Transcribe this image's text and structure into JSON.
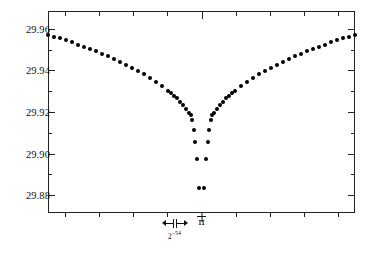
{
  "chart_data": {
    "type": "scatter",
    "title": "",
    "subtitle": "",
    "xlabel": "",
    "ylabel": "",
    "xlim": [
      -1.0,
      1.0
    ],
    "ylim": [
      29.8715,
      29.9685
    ],
    "grid": false,
    "legend": null,
    "y_ticks_major": [
      "29.96",
      "29.94",
      "29.92",
      "29.90",
      "29.88"
    ],
    "y_ticks_major_values": [
      29.96,
      29.94,
      29.92,
      29.9,
      29.88
    ],
    "y_minor_ticks_between": 1,
    "x_tick_count": 9,
    "x_center_annotation": "π",
    "x_span_annotation": "2",
    "x_span_exponent": "−54",
    "x_span_annotation_full": "2⁻⁵⁴",
    "series": [
      {
        "name": "computed value",
        "marker": "filled-circle",
        "color": "#000000",
        "points": [
          [
            -1.0,
            29.9571
          ],
          [
            -0.9608,
            29.9562
          ],
          [
            -0.9216,
            29.9553
          ],
          [
            -0.8824,
            29.9544
          ],
          [
            -0.8431,
            29.9534
          ],
          [
            -0.8039,
            29.9524
          ],
          [
            -0.7647,
            29.9514
          ],
          [
            -0.7255,
            29.9503
          ],
          [
            -0.6863,
            29.9492
          ],
          [
            -0.6471,
            29.948
          ],
          [
            -0.6078,
            29.9468
          ],
          [
            -0.5686,
            29.9455
          ],
          [
            -0.5294,
            29.9442
          ],
          [
            -0.4902,
            29.9428
          ],
          [
            -0.451,
            29.9413
          ],
          [
            -0.4118,
            29.9398
          ],
          [
            -0.3725,
            29.9381
          ],
          [
            -0.3333,
            29.9364
          ],
          [
            -0.2941,
            29.9345
          ],
          [
            -0.2549,
            29.9325
          ],
          [
            -0.2157,
            29.9303
          ],
          [
            -0.1961,
            29.9291
          ],
          [
            -0.1765,
            29.9279
          ],
          [
            -0.1569,
            29.9265
          ],
          [
            -0.1373,
            29.925
          ],
          [
            -0.1176,
            29.9234
          ],
          [
            -0.098,
            29.9216
          ],
          [
            -0.0784,
            29.9196
          ],
          [
            -0.0686,
            29.9184
          ],
          [
            -0.0588,
            29.916
          ],
          [
            -0.049,
            29.9114
          ],
          [
            -0.0392,
            29.9057
          ],
          [
            -0.0294,
            29.8975
          ],
          [
            -0.0147,
            29.8835
          ],
          [
            0.0147,
            29.8835
          ],
          [
            0.0294,
            29.8975
          ],
          [
            0.0392,
            29.9057
          ],
          [
            0.049,
            29.9114
          ],
          [
            0.0588,
            29.916
          ],
          [
            0.0686,
            29.9184
          ],
          [
            0.0784,
            29.9196
          ],
          [
            0.098,
            29.9216
          ],
          [
            0.1176,
            29.9234
          ],
          [
            0.1373,
            29.925
          ],
          [
            0.1569,
            29.9265
          ],
          [
            0.1765,
            29.9279
          ],
          [
            0.1961,
            29.9291
          ],
          [
            0.2157,
            29.9303
          ],
          [
            0.2549,
            29.9325
          ],
          [
            0.2941,
            29.9345
          ],
          [
            0.3333,
            29.9364
          ],
          [
            0.3725,
            29.9381
          ],
          [
            0.4118,
            29.9398
          ],
          [
            0.451,
            29.9413
          ],
          [
            0.4902,
            29.9428
          ],
          [
            0.5294,
            29.9442
          ],
          [
            0.5686,
            29.9455
          ],
          [
            0.6078,
            29.9468
          ],
          [
            0.6471,
            29.948
          ],
          [
            0.6863,
            29.9492
          ],
          [
            0.7255,
            29.9503
          ],
          [
            0.7647,
            29.9514
          ],
          [
            0.8039,
            29.9524
          ],
          [
            0.8431,
            29.9534
          ],
          [
            0.8824,
            29.9544
          ],
          [
            0.9216,
            29.9553
          ],
          [
            0.9608,
            29.9562
          ],
          [
            1.0,
            29.9571
          ]
        ]
      }
    ]
  }
}
